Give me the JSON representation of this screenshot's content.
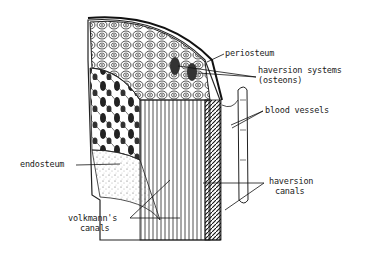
{
  "diagram": {
    "labels": {
      "periosteum": "periosteum",
      "haversion_systems": "haversion systems",
      "osteons": "(osteons)",
      "blood_vessels": "blood vessels",
      "endosteum": "endosteum",
      "haversion_canals_1": "haversion",
      "haversion_canals_2": "canals",
      "volkmanns_canals_1": "volkmann's",
      "volkmanns_canals_2": "canals"
    },
    "colors": {
      "ink": "#1a1a1a",
      "background": "#ffffff"
    }
  }
}
